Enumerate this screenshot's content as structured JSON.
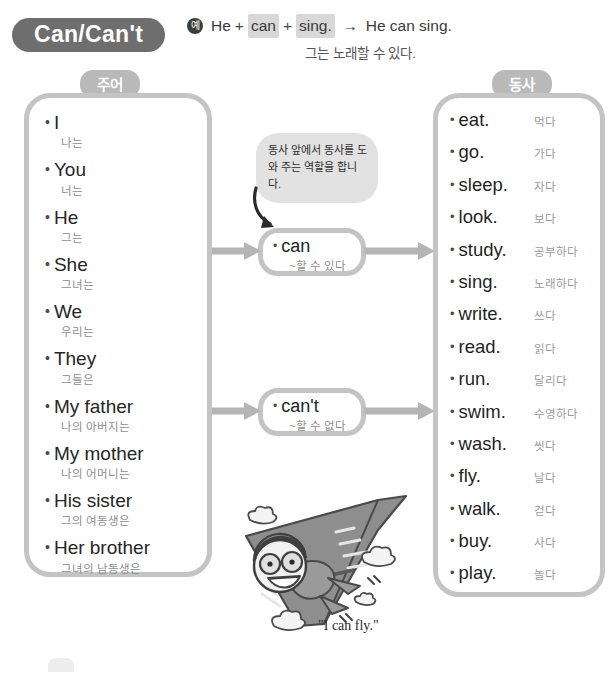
{
  "header": {
    "title": "Can/Can't",
    "example_badge": "예",
    "example_parts": {
      "subject": "He",
      "plus1": "+",
      "modal": "can",
      "plus2": "+",
      "verb": "sing.",
      "arrow": "→",
      "result": "He can sing."
    },
    "example_korean": "그는 노래할 수 있다."
  },
  "columns": {
    "subject_tag": "주어",
    "verb_tag": "동사"
  },
  "subjects": [
    {
      "en": "I",
      "ko": "나는"
    },
    {
      "en": "You",
      "ko": "너는"
    },
    {
      "en": "He",
      "ko": "그는"
    },
    {
      "en": "She",
      "ko": "그녀는"
    },
    {
      "en": "We",
      "ko": "우리는"
    },
    {
      "en": "They",
      "ko": "그들은"
    },
    {
      "en": "My father",
      "ko": "나의 아버지는"
    },
    {
      "en": "My mother",
      "ko": "나의 어머니는"
    },
    {
      "en": "His sister",
      "ko": "그의 여동생은"
    },
    {
      "en": "Her brother",
      "ko": "그녀의 남동생은"
    }
  ],
  "modals": [
    {
      "en": "can",
      "ko": "~할 수 있다"
    },
    {
      "en": "can't",
      "ko": "~할 수 없다"
    }
  ],
  "verbs": [
    {
      "en": "eat.",
      "ko": "먹다"
    },
    {
      "en": "go.",
      "ko": "가다"
    },
    {
      "en": "sleep.",
      "ko": "자다"
    },
    {
      "en": "look.",
      "ko": "보다"
    },
    {
      "en": "study.",
      "ko": "공부하다"
    },
    {
      "en": "sing.",
      "ko": "노래하다"
    },
    {
      "en": "write.",
      "ko": "쓰다"
    },
    {
      "en": "read.",
      "ko": "읽다"
    },
    {
      "en": "run.",
      "ko": "달리다"
    },
    {
      "en": "swim.",
      "ko": "수영하다"
    },
    {
      "en": "wash.",
      "ko": "씻다"
    },
    {
      "en": "fly.",
      "ko": "날다"
    },
    {
      "en": "walk.",
      "ko": "걷다"
    },
    {
      "en": "buy.",
      "ko": "사다"
    },
    {
      "en": "play.",
      "ko": "놀다"
    }
  ],
  "note_bubble": "동사 앞에서 동사를 도와 주는 역할을 합니다.",
  "illustration": {
    "caption": "\"I can fly.\"",
    "alt_name": "hang-glider-pilot"
  },
  "colors": {
    "title_pill": "#6e6e6e",
    "tag": "#b9b9b9",
    "panel_border": "#c4c4c4",
    "bubble": "#e2e2e2",
    "arrow": "#b5b5b5",
    "korean_text": "#8d8d8d"
  }
}
